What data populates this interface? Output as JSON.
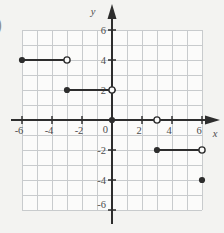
{
  "figure": {
    "stray_label_fragment": ")",
    "origin_label": "0"
  },
  "colors": {
    "page_background": "#f3f3f1",
    "plot_background": "#fbfbfa",
    "grid_line": "#c8cbcd",
    "axis": "#2d2d2d",
    "data_line": "#2d2d2d",
    "open_point_fill": "#fbfbfa",
    "tick_label": "#4d4d4d"
  },
  "chart_data": {
    "type": "line",
    "subtype": "step-function",
    "title": "",
    "xlabel": "x",
    "ylabel": "y",
    "xlim": [
      -6,
      6
    ],
    "ylim": [
      -6,
      6
    ],
    "grid": true,
    "grid_step": 1,
    "x_tick_labels": [
      "-6",
      "-4",
      "-2",
      "2",
      "4",
      "6"
    ],
    "x_tick_values": [
      -6,
      -4,
      -2,
      2,
      4,
      6
    ],
    "y_tick_labels": [
      "6",
      "4",
      "2",
      "-2",
      "-4",
      "-6"
    ],
    "y_tick_values": [
      6,
      4,
      2,
      -2,
      -4,
      -6
    ],
    "series": [
      {
        "name": "step-segment-1",
        "x": [
          -6,
          -3
        ],
        "y": [
          4,
          4
        ],
        "left_endpoint": "closed",
        "right_endpoint": "open"
      },
      {
        "name": "step-segment-2",
        "x": [
          -3,
          0
        ],
        "y": [
          2,
          2
        ],
        "left_endpoint": "closed",
        "right_endpoint": "open"
      },
      {
        "name": "step-segment-3",
        "x": [
          0,
          3
        ],
        "y": [
          0,
          0
        ],
        "left_endpoint": "closed",
        "right_endpoint": "open"
      },
      {
        "name": "step-segment-4",
        "x": [
          3,
          6
        ],
        "y": [
          -2,
          -2
        ],
        "left_endpoint": "closed",
        "right_endpoint": "open"
      },
      {
        "name": "step-point-5",
        "x": [
          6
        ],
        "y": [
          -4
        ],
        "left_endpoint": "closed",
        "right_endpoint": "none"
      }
    ],
    "legend": null
  }
}
